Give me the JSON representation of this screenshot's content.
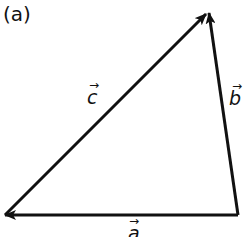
{
  "figure_label": "(a)",
  "vectors": [
    {
      "name": "a",
      "label": "a⃗",
      "from": "bottom-right",
      "to": "bottom-left"
    },
    {
      "name": "b",
      "label": "b⃗",
      "from": "bottom-right",
      "to": "top"
    },
    {
      "name": "c",
      "label": "c⃗",
      "from": "bottom-left",
      "to": "top"
    }
  ],
  "labels": {
    "a": "a",
    "b": "b",
    "c": "c"
  },
  "colors": {
    "stroke": "#111111",
    "background": "#ffffff"
  }
}
